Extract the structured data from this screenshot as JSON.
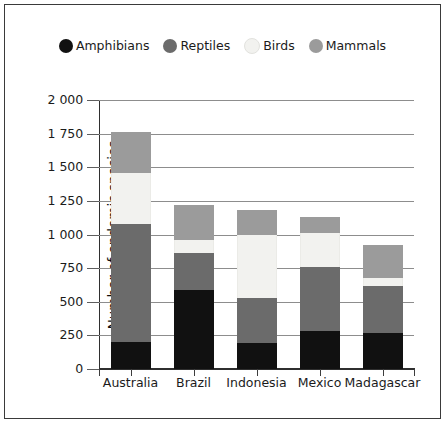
{
  "legend": {
    "items": [
      {
        "label": "Amphibians",
        "color": "#111111",
        "icon": "circle-marker-icon"
      },
      {
        "label": "Reptiles",
        "color": "#6b6b6b",
        "icon": "circle-marker-icon"
      },
      {
        "label": "Birds",
        "color": "#f2f2ef",
        "icon": "circle-marker-icon"
      },
      {
        "label": "Mammals",
        "color": "#9b9b9b",
        "icon": "circle-marker-icon"
      }
    ]
  },
  "chart_data": {
    "type": "bar",
    "subtype": "stacked-bar",
    "title": "",
    "xlabel": "",
    "ylabel": "Number of endemic species",
    "ylim": [
      0,
      2000
    ],
    "ytick_step": 250,
    "ytick_labels": [
      "0",
      "250",
      "500",
      "750",
      "1 000",
      "1 250",
      "1 500",
      "1 750",
      "2 000"
    ],
    "ytick_values": [
      0,
      250,
      500,
      750,
      1000,
      1250,
      1500,
      1750,
      2000
    ],
    "grid": true,
    "legend_position": "top",
    "categories": [
      "Australia",
      "Brazil",
      "Indonesia",
      "Mexico",
      "Madagascar"
    ],
    "series": [
      {
        "name": "Amphibians",
        "color": "#111111",
        "values": [
          200,
          590,
          195,
          280,
          270
        ]
      },
      {
        "name": "Reptiles",
        "color": "#6b6b6b",
        "values": [
          880,
          270,
          335,
          480,
          350
        ]
      },
      {
        "name": "Birds",
        "color": "#f2f2ef",
        "values": [
          380,
          100,
          470,
          250,
          60
        ]
      },
      {
        "name": "Mammals",
        "color": "#9b9b9b",
        "values": [
          300,
          260,
          185,
          120,
          240
        ]
      }
    ],
    "totals": [
      1760,
      1220,
      1185,
      1130,
      920
    ]
  }
}
